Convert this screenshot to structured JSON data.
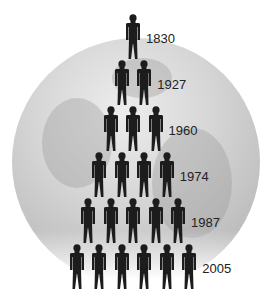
{
  "diagram": {
    "rows": [
      {
        "year": "1830",
        "count": 1
      },
      {
        "year": "1927",
        "count": 2
      },
      {
        "year": "1960",
        "count": 3
      },
      {
        "year": "1974",
        "count": 4
      },
      {
        "year": "1987",
        "count": 5
      },
      {
        "year": "2005",
        "count": 6
      }
    ],
    "colors": {
      "figure": "#1c1c1c",
      "globe": "#c8c8c8",
      "text": "#222222"
    },
    "icons": {
      "person": "person-icon",
      "globe": "globe-icon"
    }
  }
}
